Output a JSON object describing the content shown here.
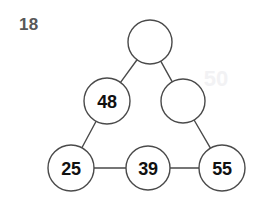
{
  "page": {
    "background_color": "#ffffff",
    "width": 262,
    "height": 203
  },
  "problem": {
    "number_label": "18",
    "number_color": "#585858"
  },
  "watermark": {
    "text": "50",
    "color": "#f2f2f4"
  },
  "diagram": {
    "type": "triangle-number-puzzle",
    "stroke_color": "#4a4a4a",
    "fill_color": "#ffffff",
    "label_color": "#111111",
    "nodes": [
      {
        "id": "apex",
        "label": "",
        "filled": false,
        "cx": 150,
        "cy": 42,
        "r": 22
      },
      {
        "id": "left-upper",
        "label": "48",
        "filled": true,
        "cx": 107,
        "cy": 101,
        "r": 23
      },
      {
        "id": "right-upper",
        "label": "",
        "filled": false,
        "cx": 183,
        "cy": 101,
        "r": 22
      },
      {
        "id": "bottom-left",
        "label": "25",
        "filled": true,
        "cx": 71,
        "cy": 168,
        "r": 23
      },
      {
        "id": "bottom-mid",
        "label": "39",
        "filled": true,
        "cx": 148,
        "cy": 168,
        "r": 22
      },
      {
        "id": "bottom-right",
        "label": "55",
        "filled": true,
        "cx": 222,
        "cy": 168,
        "r": 23
      }
    ],
    "edges": [
      {
        "id": "apex-to-left-upper",
        "from": "apex",
        "to": "left-upper"
      },
      {
        "id": "apex-to-right-upper",
        "from": "apex",
        "to": "right-upper"
      },
      {
        "id": "left-upper-to-bottom-left",
        "from": "left-upper",
        "to": "bottom-left"
      },
      {
        "id": "right-upper-to-bottom-right",
        "from": "right-upper",
        "to": "bottom-right"
      },
      {
        "id": "bottom-left-to-bottom-mid",
        "from": "bottom-left",
        "to": "bottom-mid"
      },
      {
        "id": "bottom-mid-to-bottom-right",
        "from": "bottom-mid",
        "to": "bottom-right"
      }
    ]
  }
}
